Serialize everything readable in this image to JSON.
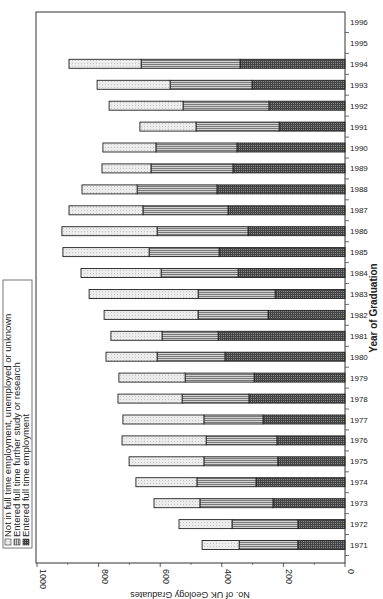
{
  "chart_data": {
    "type": "bar",
    "orientation": "stacked-horizontal-rotated",
    "title": "",
    "xlabel": "Year of Graduation",
    "ylabel": "No. of UK Geology Graduates",
    "ylim": [
      0,
      1000
    ],
    "yticks": [
      0,
      200,
      400,
      600,
      800,
      1000
    ],
    "ytick_labels": [
      "0",
      "200",
      "400",
      "600",
      "800",
      "1000"
    ],
    "grid": false,
    "legend_position": "left",
    "categories": [
      "1971",
      "1972",
      "1973",
      "1974",
      "1975",
      "1976",
      "1977",
      "1978",
      "1979",
      "1980",
      "1981",
      "1982",
      "1983",
      "1984",
      "1985",
      "1986",
      "1987",
      "1988",
      "1989",
      "1990",
      "1991",
      "1992",
      "1993",
      "1994",
      "1995",
      "1996"
    ],
    "series": [
      {
        "name": "Entered full time employment",
        "pattern": "dark-grid",
        "color": "#555555",
        "values": [
          153,
          153,
          234,
          289,
          218,
          221,
          266,
          312,
          295,
          390,
          412,
          250,
          227,
          347,
          409,
          315,
          380,
          416,
          364,
          351,
          214,
          247,
          302,
          341,
          null,
          null
        ]
      },
      {
        "name": "Entered full time further study or research",
        "pattern": "horizontal-lines",
        "color": "#9a9a9a",
        "values": [
          191,
          214,
          237,
          192,
          240,
          230,
          192,
          217,
          224,
          220,
          182,
          227,
          250,
          250,
          227,
          295,
          276,
          259,
          266,
          263,
          270,
          279,
          266,
          321,
          null,
          null
        ]
      },
      {
        "name": "Not in full time employment, unemployed or unknown",
        "pattern": "light-dots",
        "color": "#e6e6e6",
        "values": [
          120,
          172,
          149,
          198,
          243,
          273,
          263,
          208,
          215,
          166,
          166,
          305,
          354,
          260,
          280,
          309,
          240,
          179,
          159,
          172,
          182,
          240,
          237,
          234,
          null,
          null
        ]
      }
    ],
    "legend": [
      "Not in full time employment, unemployed or unknown",
      "Entered full time further study or research",
      "Entered full time employment"
    ]
  }
}
